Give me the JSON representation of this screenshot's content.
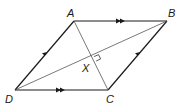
{
  "diagram": {
    "type": "parallelogram-with-diagonals",
    "vertices": {
      "A": {
        "label": "A",
        "x": 74,
        "y": 21
      },
      "B": {
        "label": "B",
        "x": 167,
        "y": 21
      },
      "C": {
        "label": "C",
        "x": 108,
        "y": 90
      },
      "D": {
        "label": "D",
        "x": 15,
        "y": 90
      }
    },
    "intersection": {
      "label": "X",
      "x": 91,
      "y": 58
    },
    "markings": {
      "AB_DC": "double-arrow",
      "DA_CB": "single-arrow",
      "AC_perp_DB": "right-angle"
    },
    "colors": {
      "sides": "#1a1a1a",
      "diagonals": "#555555",
      "labels": "#1a1a1a"
    }
  }
}
